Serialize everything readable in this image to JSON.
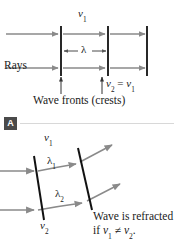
{
  "figure": {
    "panel_label": "A",
    "top_panel": {
      "speed_top_label": "v",
      "speed_top_sub": "1",
      "wavelength_label": "λ",
      "rays_label": "Rays",
      "speed_equality_left": "v",
      "speed_equality_left_sub": "2",
      "speed_equality_op": "=",
      "speed_equality_right": "v",
      "speed_equality_right_sub": "1",
      "wavefronts_caption": "Wave fronts (crests)"
    },
    "bottom_panel": {
      "speed_upper_label": "v",
      "speed_upper_sub": "1",
      "wavelength_upper_label": "λ",
      "wavelength_upper_sub": "1",
      "wavelength_lower_label": "λ",
      "wavelength_lower_sub": "2",
      "speed_lower_label": "v",
      "speed_lower_sub": "2",
      "note_line1": "Wave is refracted",
      "note_line2_prefix": "if ",
      "note_line2_v1": "v",
      "note_line2_v1_sub": "1",
      "note_line2_op": " ≠ ",
      "note_line2_v2": "v",
      "note_line2_v2_sub": "2",
      "note_line2_suffix": "."
    },
    "colors": {
      "ray_gray": "#8a8a8a",
      "wavefront_black": "#111111",
      "badge_bg": "#4a4a4a",
      "divider": "#d8d8d8",
      "text": "#1a1a1a",
      "background": "#ffffff"
    }
  }
}
